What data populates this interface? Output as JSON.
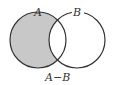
{
  "diagram": {
    "type": "venn",
    "title": "A−B",
    "sets": [
      {
        "label": "A",
        "shaded": "partial (A minus B)"
      },
      {
        "label": "B",
        "shaded": "none"
      }
    ],
    "caption": "A−B",
    "colors": {
      "shade": "#c8c8c8",
      "stroke": "#333333",
      "background": "#ffffff"
    }
  }
}
